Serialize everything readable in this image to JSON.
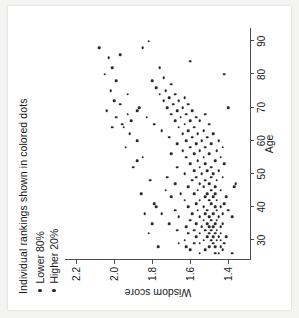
{
  "figure": {
    "title": "Individual rankings shown in colored dots",
    "legend": [
      {
        "label": "Lower 80%",
        "color": "#2b2b2b"
      },
      {
        "label": "Higher 20%",
        "color": "#2b2b2b"
      }
    ]
  },
  "chart_data": {
    "type": "scatter",
    "title": "Individual rankings shown in colored dots",
    "xlabel": "Age",
    "ylabel": "Wisdom score",
    "xlim": [
      24,
      94
    ],
    "ylim": [
      1.28,
      2.26
    ],
    "xticks": [
      30,
      40,
      50,
      60,
      70,
      80,
      90
    ],
    "yticks": [
      1.4,
      1.6,
      1.8,
      2.0,
      2.2
    ],
    "grid": false,
    "legend_position": "top-left",
    "series": [
      {
        "name": "Lower 80%",
        "color": "#2b2b2b",
        "points": [
          [
            26,
            1.38
          ],
          [
            26,
            1.45
          ],
          [
            26,
            1.47
          ],
          [
            26,
            1.55
          ],
          [
            27,
            1.52
          ],
          [
            27,
            1.6
          ],
          [
            27,
            1.43
          ],
          [
            28,
            1.5
          ],
          [
            28,
            1.47
          ],
          [
            28,
            1.62
          ],
          [
            28,
            1.44
          ],
          [
            29,
            1.55
          ],
          [
            29,
            1.48
          ],
          [
            29,
            1.42
          ],
          [
            29,
            1.58
          ],
          [
            29,
            1.66
          ],
          [
            30,
            1.46
          ],
          [
            30,
            1.49
          ],
          [
            30,
            1.44
          ],
          [
            30,
            1.53
          ],
          [
            30,
            1.63
          ],
          [
            31,
            1.45
          ],
          [
            31,
            1.51
          ],
          [
            31,
            1.48
          ],
          [
            31,
            1.57
          ],
          [
            31,
            1.41
          ],
          [
            32,
            1.5
          ],
          [
            32,
            1.47
          ],
          [
            32,
            1.55
          ],
          [
            32,
            1.61
          ],
          [
            32,
            1.44
          ],
          [
            33,
            1.49
          ],
          [
            33,
            1.52
          ],
          [
            33,
            1.46
          ],
          [
            33,
            1.58
          ],
          [
            33,
            1.67
          ],
          [
            34,
            1.48
          ],
          [
            34,
            1.54
          ],
          [
            34,
            1.44
          ],
          [
            34,
            1.5
          ],
          [
            34,
            1.62
          ],
          [
            35,
            1.47
          ],
          [
            35,
            1.51
          ],
          [
            35,
            1.57
          ],
          [
            35,
            1.43
          ],
          [
            35,
            1.71
          ],
          [
            36,
            1.49
          ],
          [
            36,
            1.46
          ],
          [
            36,
            1.53
          ],
          [
            36,
            1.6
          ],
          [
            37,
            1.45
          ],
          [
            37,
            1.5
          ],
          [
            37,
            1.55
          ],
          [
            37,
            1.38
          ],
          [
            37,
            1.66
          ],
          [
            38,
            1.48
          ],
          [
            38,
            1.43
          ],
          [
            38,
            1.52
          ],
          [
            38,
            1.59
          ],
          [
            38,
            1.75
          ],
          [
            39,
            1.46
          ],
          [
            39,
            1.51
          ],
          [
            39,
            1.4
          ],
          [
            39,
            1.56
          ],
          [
            39,
            1.68
          ],
          [
            40,
            1.47
          ],
          [
            40,
            1.53
          ],
          [
            40,
            1.44
          ],
          [
            40,
            1.61
          ],
          [
            41,
            1.49
          ],
          [
            41,
            1.57
          ],
          [
            41,
            1.42
          ],
          [
            41,
            1.79
          ],
          [
            42,
            1.5
          ],
          [
            42,
            1.46
          ],
          [
            42,
            1.55
          ],
          [
            42,
            1.63
          ],
          [
            43,
            1.48
          ],
          [
            43,
            1.52
          ],
          [
            43,
            1.41
          ],
          [
            43,
            1.7
          ],
          [
            44,
            1.47
          ],
          [
            44,
            1.58
          ],
          [
            44,
            1.51
          ],
          [
            44,
            1.65
          ],
          [
            45,
            1.49
          ],
          [
            45,
            1.44
          ],
          [
            45,
            1.56
          ],
          [
            45,
            1.73
          ],
          [
            46,
            1.53
          ],
          [
            46,
            1.47
          ],
          [
            46,
            1.37
          ],
          [
            46,
            1.61
          ],
          [
            47,
            1.5
          ],
          [
            47,
            1.55
          ],
          [
            47,
            1.36
          ],
          [
            47,
            1.68
          ],
          [
            48,
            1.52
          ],
          [
            48,
            1.46
          ],
          [
            48,
            1.59
          ],
          [
            49,
            1.49
          ],
          [
            49,
            1.57
          ],
          [
            49,
            1.43
          ],
          [
            49,
            1.72
          ],
          [
            50,
            1.54
          ],
          [
            50,
            1.48
          ],
          [
            50,
            1.63
          ],
          [
            51,
            1.51
          ],
          [
            51,
            1.58
          ],
          [
            51,
            1.45
          ],
          [
            52,
            1.55
          ],
          [
            52,
            1.49
          ],
          [
            52,
            1.67
          ],
          [
            53,
            1.52
          ],
          [
            53,
            1.6
          ],
          [
            53,
            1.42
          ],
          [
            54,
            1.56
          ],
          [
            54,
            1.47
          ],
          [
            54,
            1.88
          ],
          [
            55,
            1.53
          ],
          [
            55,
            1.62
          ],
          [
            55,
            1.44
          ],
          [
            56,
            1.58
          ],
          [
            56,
            1.5
          ],
          [
            56,
            1.7
          ],
          [
            57,
            1.55
          ],
          [
            57,
            1.46
          ],
          [
            57,
            1.64
          ],
          [
            58,
            1.6
          ],
          [
            58,
            1.52
          ],
          [
            58,
            1.43
          ],
          [
            59,
            1.57
          ],
          [
            59,
            1.67
          ],
          [
            59,
            1.49
          ],
          [
            60,
            1.62
          ],
          [
            60,
            1.54
          ],
          [
            60,
            1.45
          ],
          [
            61,
            1.59
          ],
          [
            61,
            1.71
          ],
          [
            61,
            1.51
          ],
          [
            62,
            1.64
          ],
          [
            62,
            1.56
          ],
          [
            62,
            1.48
          ],
          [
            63,
            1.61
          ],
          [
            63,
            1.75
          ],
          [
            63,
            1.53
          ],
          [
            64,
            1.66
          ],
          [
            64,
            1.58
          ],
          [
            64,
            1.95
          ],
          [
            65,
            1.63
          ],
          [
            65,
            1.5
          ],
          [
            65,
            1.79
          ],
          [
            66,
            1.68
          ],
          [
            66,
            1.6
          ],
          [
            66,
            1.55
          ],
          [
            67,
            1.65
          ],
          [
            67,
            1.57
          ],
          [
            67,
            1.83
          ],
          [
            68,
            1.7
          ],
          [
            68,
            1.62
          ],
          [
            68,
            1.52
          ],
          [
            69,
            1.67
          ],
          [
            69,
            1.59
          ],
          [
            69,
            1.88
          ],
          [
            70,
            1.72
          ],
          [
            70,
            1.64
          ],
          [
            70,
            1.4
          ],
          [
            71,
            1.69
          ],
          [
            71,
            1.61
          ],
          [
            72,
            1.74
          ],
          [
            72,
            1.66
          ],
          [
            73,
            1.71
          ],
          [
            73,
            1.63
          ],
          [
            74,
            1.76
          ],
          [
            74,
            1.68
          ],
          [
            75,
            1.73
          ],
          [
            76,
            1.78
          ],
          [
            77,
            1.7
          ],
          [
            78,
            1.8
          ],
          [
            79,
            1.74
          ],
          [
            80,
            1.42
          ],
          [
            82,
            1.76
          ],
          [
            84,
            1.6
          ],
          [
            86,
            1.97
          ],
          [
            88,
            1.85
          ],
          [
            90,
            1.82
          ]
        ]
      },
      {
        "name": "Higher 20%",
        "color": "#2b2b2b",
        "points": [
          [
            28,
            1.77
          ],
          [
            32,
            1.82
          ],
          [
            35,
            1.8
          ],
          [
            38,
            1.84
          ],
          [
            40,
            1.78
          ],
          [
            44,
            1.86
          ],
          [
            48,
            1.81
          ],
          [
            52,
            1.9
          ],
          [
            55,
            1.85
          ],
          [
            58,
            1.94
          ],
          [
            60,
            1.88
          ],
          [
            62,
            1.92
          ],
          [
            64,
            2.01
          ],
          [
            65,
            1.96
          ],
          [
            66,
            1.91
          ],
          [
            67,
            1.99
          ],
          [
            68,
            1.93
          ],
          [
            69,
            2.04
          ],
          [
            70,
            1.87
          ],
          [
            71,
            1.97
          ],
          [
            72,
            2.0
          ],
          [
            74,
            1.93
          ],
          [
            75,
            2.02
          ],
          [
            78,
            1.99
          ],
          [
            80,
            2.05
          ],
          [
            82,
            2.01
          ],
          [
            85,
            2.03
          ],
          [
            88,
            2.08
          ]
        ]
      }
    ]
  }
}
